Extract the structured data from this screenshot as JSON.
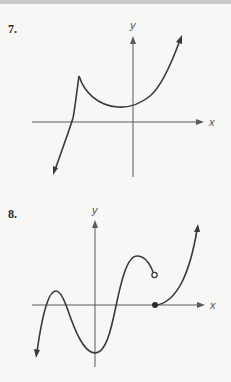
{
  "page": {
    "background": "#f7f7f5",
    "rule_color": "#c9c9c7"
  },
  "graphs": [
    {
      "number_label": "7.",
      "x_axis_label": "x",
      "y_axis_label": "y",
      "description": "Curve rising from lower-left, crossing x-axis left of origin, reaching a cusp (sharp peak), dipping to a local minimum just left of the y-axis, then rising steeply to upper right.",
      "features": [
        "cusp",
        "local-minimum",
        "x-intercept-negative",
        "arrow-ends"
      ]
    },
    {
      "number_label": "8.",
      "x_axis_label": "x",
      "y_axis_label": "y",
      "description": "Oscillating curve: rises from lower-left, local max above x-axis, local min below origin, local max, ends at an open circle; then a separate piece begins at a filled dot on the x-axis and rises to upper right.",
      "features": [
        "local-maximum",
        "local-minimum",
        "open-circle",
        "closed-dot",
        "jump-discontinuity",
        "arrow-ends"
      ]
    }
  ],
  "colors": {
    "curve": "#3a3a3a",
    "axis": "#5a5a5a",
    "label": "#2b2b2b"
  }
}
